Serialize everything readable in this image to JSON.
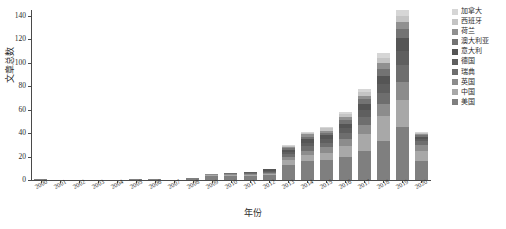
{
  "chart_data": {
    "type": "bar",
    "stacked": true,
    "title": "",
    "xlabel": "年份",
    "ylabel": "文章总数",
    "ylim": [
      0,
      145
    ],
    "yticks": [
      0,
      20,
      40,
      60,
      80,
      100,
      120,
      140
    ],
    "grid": false,
    "legend_position": "right",
    "categories": [
      "2000",
      "2001",
      "2002",
      "2003",
      "2004",
      "2005",
      "2006",
      "2007",
      "2008",
      "2009",
      "2010",
      "2011",
      "2012",
      "2013",
      "2014",
      "2015",
      "2016",
      "2017",
      "2018",
      "2019",
      "2020"
    ],
    "series": [
      {
        "name": "美国",
        "color": "#7f7f7f",
        "values": [
          1,
          0,
          0,
          0,
          0,
          1,
          1,
          0,
          2,
          3,
          3,
          3,
          4,
          13,
          16,
          17,
          20,
          25,
          33,
          45,
          16
        ]
      },
      {
        "name": "中国",
        "color": "#a8a8a8",
        "values": [
          0,
          0,
          0,
          0,
          0,
          0,
          0,
          0,
          0,
          1,
          1,
          1,
          1,
          4,
          5,
          6,
          9,
          14,
          22,
          23,
          9
        ]
      },
      {
        "name": "英国",
        "color": "#8c8c8c",
        "values": [
          0,
          0,
          0,
          0,
          0,
          0,
          0,
          0,
          0,
          1,
          1,
          1,
          1,
          3,
          4,
          5,
          6,
          8,
          10,
          16,
          5
        ]
      },
      {
        "name": "瑞典",
        "color": "#6e6e6e",
        "values": [
          0,
          0,
          0,
          0,
          0,
          0,
          0,
          0,
          0,
          0,
          1,
          1,
          1,
          2,
          4,
          4,
          5,
          7,
          9,
          14,
          3
        ]
      },
      {
        "name": "德国",
        "color": "#5f5f5f",
        "values": [
          0,
          0,
          0,
          0,
          0,
          0,
          0,
          0,
          0,
          0,
          0,
          1,
          1,
          2,
          3,
          3,
          4,
          6,
          8,
          12,
          2
        ]
      },
      {
        "name": "意大利",
        "color": "#555555",
        "values": [
          0,
          0,
          0,
          0,
          0,
          0,
          0,
          0,
          0,
          0,
          0,
          0,
          1,
          2,
          3,
          3,
          4,
          5,
          7,
          11,
          2
        ]
      },
      {
        "name": "澳大利亚",
        "color": "#737373",
        "values": [
          0,
          0,
          0,
          0,
          0,
          0,
          0,
          0,
          0,
          0,
          0,
          0,
          0,
          1,
          2,
          2,
          3,
          4,
          6,
          8,
          1
        ]
      },
      {
        "name": "荷兰",
        "color": "#909090",
        "values": [
          0,
          0,
          0,
          0,
          0,
          0,
          0,
          0,
          0,
          0,
          0,
          0,
          0,
          1,
          2,
          2,
          3,
          3,
          5,
          6,
          1
        ]
      },
      {
        "name": "西班牙",
        "color": "#c4c4c4",
        "values": [
          0,
          0,
          0,
          0,
          0,
          0,
          0,
          0,
          0,
          0,
          0,
          0,
          0,
          1,
          1,
          2,
          2,
          3,
          4,
          5,
          1
        ]
      },
      {
        "name": "加拿大",
        "color": "#d6d6d6",
        "values": [
          0,
          0,
          0,
          0,
          0,
          0,
          0,
          0,
          0,
          0,
          0,
          0,
          0,
          1,
          1,
          1,
          2,
          3,
          4,
          5,
          1
        ]
      }
    ]
  },
  "legend": {
    "items": [
      {
        "label": "加拿大",
        "color": "#d6d6d6"
      },
      {
        "label": "西班牙",
        "color": "#c4c4c4"
      },
      {
        "label": "荷兰",
        "color": "#909090"
      },
      {
        "label": "澳大利亚",
        "color": "#737373"
      },
      {
        "label": "意大利",
        "color": "#555555"
      },
      {
        "label": "德国",
        "color": "#5f5f5f"
      },
      {
        "label": "瑞典",
        "color": "#6e6e6e"
      },
      {
        "label": "英国",
        "color": "#8c8c8c"
      },
      {
        "label": "中国",
        "color": "#a8a8a8"
      },
      {
        "label": "美国",
        "color": "#7f7f7f"
      }
    ]
  }
}
